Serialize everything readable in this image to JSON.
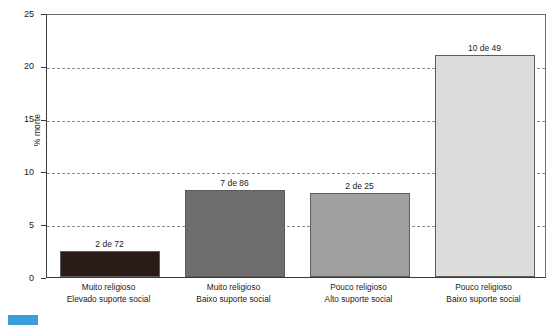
{
  "chart_data": {
    "type": "bar",
    "title": "",
    "xlabel": "",
    "ylabel": "% morte",
    "ylim": [
      0,
      25
    ],
    "yticks": [
      0,
      5,
      10,
      15,
      20,
      25
    ],
    "ytick_labels": [
      "0",
      "5",
      "10",
      "15",
      "20",
      "25"
    ],
    "grid": "horizontal-dashed",
    "legend": "none",
    "categories": [
      "Muito religioso Elevado suporte social",
      "Muito religioso Baixo suporte social",
      "Pouco religioso Alto suporte social",
      "Pouco religioso Baixo suporte social"
    ],
    "category_lines": [
      [
        "Muito religioso",
        "Elevado suporte social"
      ],
      [
        "Muito religioso",
        "Baixo suporte social"
      ],
      [
        "Pouco religioso",
        "Alto suporte social"
      ],
      [
        "Pouco religioso",
        "Baixo suporte social"
      ]
    ],
    "values": [
      2.5,
      8.2,
      8.0,
      21.0
    ],
    "data_labels": [
      "2 de 72",
      "7 de 86",
      "2 de 25",
      "10 de 49"
    ],
    "bar_colors": [
      "#2a1a18",
      "#6e6e6e",
      "#a0a0a0",
      "#dcdcdc"
    ],
    "bar_border_color": "#5d5d5d"
  },
  "axis": {
    "y_title": "% morte",
    "ticks": [
      {
        "label": "25",
        "value": 25
      },
      {
        "label": "20",
        "value": 20
      },
      {
        "label": "15",
        "value": 15
      },
      {
        "label": "10",
        "value": 10
      },
      {
        "label": "5",
        "value": 5
      },
      {
        "label": "0",
        "value": 0
      }
    ]
  },
  "bars": [
    {
      "data_label": "2 de 72",
      "line1": "Muito religioso",
      "line2": "Elevado suporte social",
      "value": 2.5,
      "color": "#2a1a18"
    },
    {
      "data_label": "7 de 86",
      "line1": "Muito religioso",
      "line2": "Baixo suporte social",
      "value": 8.2,
      "color": "#6e6e6e"
    },
    {
      "data_label": "2 de 25",
      "line1": "Pouco religioso",
      "line2": "Alto suporte social",
      "value": 8.0,
      "color": "#a0a0a0"
    },
    {
      "data_label": "10 de 49",
      "line1": "Pouco religioso",
      "line2": "Baixo suporte social",
      "value": 21.0,
      "color": "#dcdcdc"
    }
  ]
}
